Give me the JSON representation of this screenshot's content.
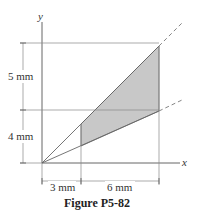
{
  "figure": {
    "caption": "Figure P5-82",
    "axes": {
      "x_label": "x",
      "y_label": "y"
    },
    "dimensions": {
      "vertical_upper": "5 mm",
      "vertical_lower": "4 mm",
      "horizontal_left": "3 mm",
      "horizontal_right": "6 mm"
    },
    "colors": {
      "shade": "#c8c8c8",
      "line": "#555555"
    }
  }
}
